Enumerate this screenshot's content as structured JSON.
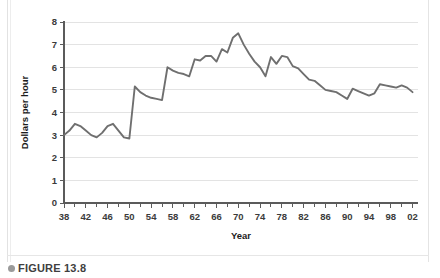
{
  "figure": {
    "caption_label": "FIGURE 13.8",
    "bullet_icon": "bullet-icon"
  },
  "chart_data": {
    "type": "line",
    "title": "",
    "xlabel": "Year",
    "ylabel": "Dollars per hour",
    "xlim": [
      38,
      103
    ],
    "ylim": [
      0,
      8
    ],
    "grid": true,
    "legend": "none",
    "line_color": "#6f6f6f",
    "grid_color": "#dcdcdc",
    "axis_color": "#5b5b5b",
    "y_ticks": [
      0,
      1,
      2,
      3,
      4,
      5,
      6,
      7,
      8
    ],
    "y_tick_labels": [
      "0",
      "1",
      "2",
      "3",
      "4",
      "5",
      "6",
      "7",
      "8"
    ],
    "x_tick_labels": [
      "38",
      "42",
      "46",
      "50",
      "54",
      "58",
      "62",
      "66",
      "70",
      "74",
      "78",
      "82",
      "86",
      "90",
      "94",
      "98",
      "02"
    ],
    "x_tick_values": [
      38,
      42,
      46,
      50,
      54,
      58,
      62,
      66,
      70,
      74,
      78,
      82,
      86,
      90,
      94,
      98,
      102
    ],
    "x_minor_tick_values": [
      40,
      44,
      48,
      52,
      56,
      60,
      64,
      68,
      72,
      76,
      80,
      84,
      88,
      92,
      96,
      100
    ],
    "x": [
      38,
      39,
      40,
      41,
      42,
      43,
      44,
      45,
      46,
      47,
      48,
      49,
      50,
      51,
      52,
      53,
      54,
      55,
      56,
      57,
      58,
      59,
      60,
      61,
      62,
      63,
      64,
      65,
      66,
      67,
      68,
      69,
      70,
      71,
      72,
      73,
      74,
      75,
      76,
      77,
      78,
      79,
      80,
      81,
      82,
      83,
      84,
      85,
      86,
      87,
      88,
      89,
      90,
      91,
      92,
      93,
      94,
      95,
      96,
      97,
      98,
      99,
      100,
      101,
      102
    ],
    "values": [
      3.0,
      3.2,
      3.5,
      3.4,
      3.2,
      3.0,
      2.9,
      3.1,
      3.4,
      3.5,
      3.2,
      2.9,
      2.85,
      5.15,
      4.9,
      4.75,
      4.65,
      4.6,
      4.55,
      6.0,
      5.85,
      5.75,
      5.7,
      5.6,
      6.35,
      6.3,
      6.5,
      6.5,
      6.25,
      6.8,
      6.65,
      7.3,
      7.5,
      7.0,
      6.6,
      6.25,
      6.0,
      5.6,
      6.45,
      6.15,
      6.5,
      6.45,
      6.05,
      5.95,
      5.7,
      5.45,
      5.4,
      5.2,
      5.0,
      4.95,
      4.9,
      4.75,
      4.6,
      5.05,
      4.95,
      4.85,
      4.75,
      4.85,
      5.25,
      5.2,
      5.15,
      5.1,
      5.2,
      5.1,
      4.9
    ],
    "series": [
      {
        "name": "Dollars per hour",
        "values": [
          3.0,
          3.2,
          3.5,
          3.4,
          3.2,
          3.0,
          2.9,
          3.1,
          3.4,
          3.5,
          3.2,
          2.9,
          2.85,
          5.15,
          4.9,
          4.75,
          4.65,
          4.6,
          4.55,
          6.0,
          5.85,
          5.75,
          5.7,
          5.6,
          6.35,
          6.3,
          6.5,
          6.5,
          6.25,
          6.8,
          6.65,
          7.3,
          7.5,
          7.0,
          6.6,
          6.25,
          6.0,
          5.6,
          6.45,
          6.15,
          6.5,
          6.45,
          6.05,
          5.95,
          5.7,
          5.45,
          5.4,
          5.2,
          5.0,
          4.95,
          4.9,
          4.75,
          4.6,
          5.05,
          4.95,
          4.85,
          4.75,
          4.85,
          5.25,
          5.2,
          5.15,
          5.1,
          5.2,
          5.1,
          4.9
        ]
      }
    ]
  }
}
